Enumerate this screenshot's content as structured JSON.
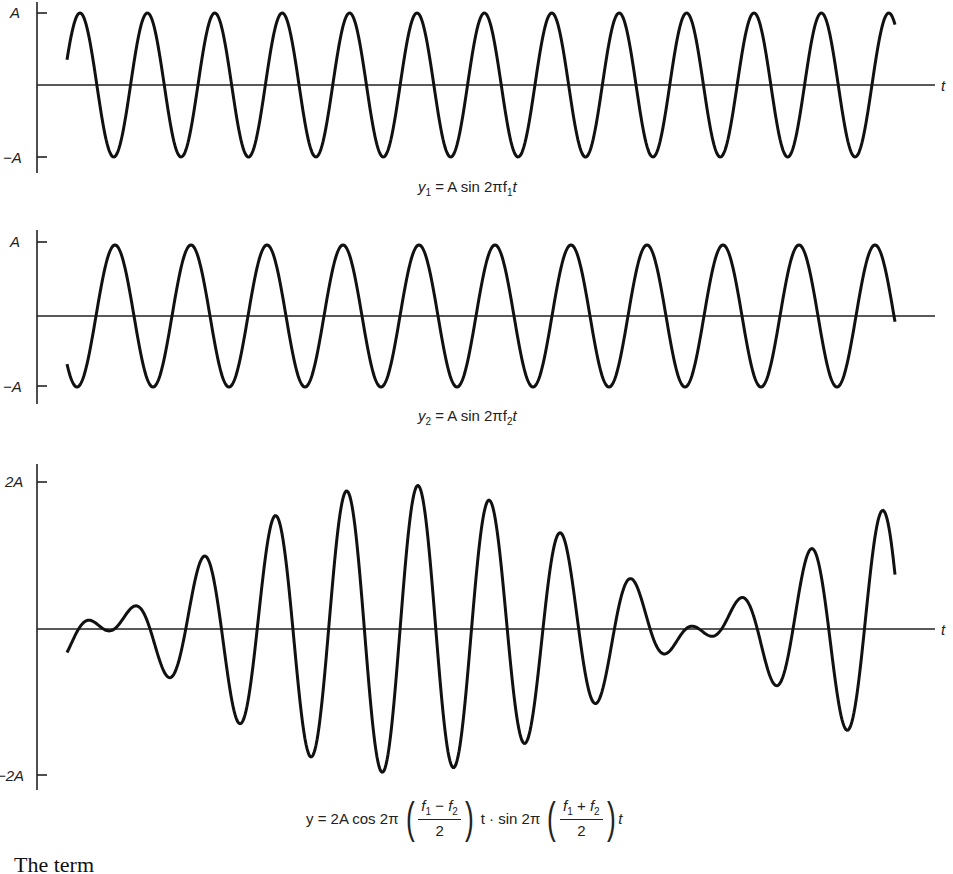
{
  "figure": {
    "panels": [
      {
        "id": "y1",
        "y_tick_top_label": "A",
        "y_tick_bottom_label": "−A",
        "axis_label": "t",
        "caption": {
          "lhs": "y",
          "lhs_sub": "1",
          "rhs": "= A sin 2πf",
          "rhs_sub": "1",
          "tail": "t"
        }
      },
      {
        "id": "y2",
        "y_tick_top_label": "A",
        "y_tick_bottom_label": "−A",
        "axis_label": "",
        "caption": {
          "lhs": "y",
          "lhs_sub": "2",
          "rhs": "= A sin 2πf",
          "rhs_sub": "2",
          "tail": "t"
        }
      },
      {
        "id": "y",
        "y_tick_top_label": "2A",
        "y_tick_bottom_label": "−2A",
        "axis_label": "t",
        "caption": {
          "lhs": "y = 2A cos 2π",
          "frac1_num_a": "f",
          "frac1_num_a_sub": "1",
          "frac1_op": " − ",
          "frac1_num_b": "f",
          "frac1_num_b_sub": "2",
          "frac1_den": "2",
          "mid": "t · sin 2π",
          "frac2_num_a": "f",
          "frac2_num_a_sub": "1",
          "frac2_op": " + ",
          "frac2_num_b": "f",
          "frac2_num_b_sub": "2",
          "frac2_den": "2",
          "tail": "t"
        }
      }
    ],
    "body_text": "The term"
  },
  "chart_data": [
    {
      "type": "line",
      "title": "y1 = A sin 2πf1 t",
      "xlabel": "t",
      "ylabel": "",
      "yticks": [
        "A",
        "−A"
      ],
      "ylim": [
        -1,
        1
      ],
      "grid": false,
      "series": [
        {
          "name": "y1",
          "function": "A sin(2π f1 t)",
          "amplitude": 1,
          "cycles_shown": 12.2,
          "period_px": 67.4,
          "phase_peak_px": 80
        }
      ]
    },
    {
      "type": "line",
      "title": "y2 = A sin 2πf2 t",
      "xlabel": "",
      "ylabel": "",
      "yticks": [
        "A",
        "−A"
      ],
      "ylim": [
        -1,
        1
      ],
      "grid": false,
      "series": [
        {
          "name": "y2",
          "function": "A sin(2π f2 t)",
          "amplitude": 1,
          "cycles_shown": 10.8,
          "period_px": 76,
          "phase_peak_px": 115
        }
      ]
    },
    {
      "type": "line",
      "title": "y = 2A cos 2π((f1 − f2)/2)t · sin 2π((f1 + f2)/2)t",
      "xlabel": "t",
      "ylabel": "",
      "yticks": [
        "2A",
        "−2A"
      ],
      "ylim": [
        -2,
        2
      ],
      "grid": false,
      "series": [
        {
          "name": "y = y1 + y2",
          "function": "y1 + y2 (beats)",
          "amplitude": 2,
          "envelope_max_at_px": 417
        }
      ]
    }
  ],
  "style": {
    "line_color": "#111111",
    "axis_color": "#222222",
    "background": "#ffffff"
  }
}
